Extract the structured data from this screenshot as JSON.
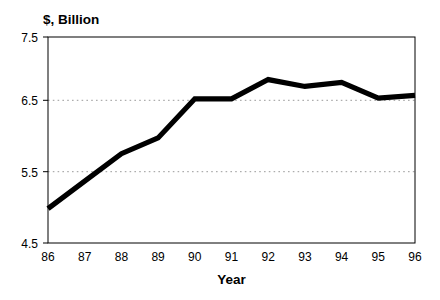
{
  "chart_data": {
    "type": "line",
    "title": "",
    "subtitle": "",
    "xlabel": "Year",
    "ylabel": "$, Billion",
    "ylabel_position": "top-left",
    "categories": [
      "86",
      "87",
      "88",
      "89",
      "90",
      "91",
      "92",
      "93",
      "94",
      "95",
      "96"
    ],
    "x": [
      86,
      87,
      88,
      89,
      90,
      91,
      92,
      93,
      94,
      95,
      96
    ],
    "values": [
      5.0,
      5.4,
      5.8,
      6.03,
      6.6,
      6.6,
      6.88,
      6.78,
      6.84,
      6.61,
      6.65
    ],
    "series": [
      {
        "name": "",
        "values": [
          5.0,
          5.4,
          5.8,
          6.03,
          6.6,
          6.6,
          6.88,
          6.78,
          6.84,
          6.61,
          6.65
        ],
        "color": "#000000",
        "line_width": 5.2
      }
    ],
    "ylim": [
      4.5,
      7.5
    ],
    "xlim": [
      86,
      96
    ],
    "yticks": [
      4.5,
      5.5,
      6.5,
      7.5
    ],
    "ytick_labels": [
      "4.5",
      "5.5",
      "6.5",
      "7.5"
    ],
    "xticks": [
      86,
      87,
      88,
      89,
      90,
      91,
      92,
      93,
      94,
      95,
      96
    ],
    "xtick_labels": [
      "86",
      "87",
      "88",
      "89",
      "90",
      "91",
      "92",
      "93",
      "94",
      "95",
      "96"
    ],
    "gridlines": {
      "horizontal": [
        5.5,
        6.5
      ],
      "style": "dotted",
      "color": "#9a9a9a",
      "vertical": []
    },
    "legend": {
      "visible": false,
      "position": "none",
      "entries": []
    },
    "annotations": [],
    "frame": {
      "color": "#000000",
      "background": "#ffffff"
    }
  },
  "labels": {
    "y_axis_unit": "$, Billion",
    "x_axis_title": "Year",
    "ytick_0": "4.5",
    "ytick_1": "5.5",
    "ytick_2": "6.5",
    "ytick_3": "7.5",
    "xtick_0": "86",
    "xtick_1": "87",
    "xtick_2": "88",
    "xtick_3": "89",
    "xtick_4": "90",
    "xtick_5": "91",
    "xtick_6": "92",
    "xtick_7": "93",
    "xtick_8": "94",
    "xtick_9": "95",
    "xtick_10": "96"
  }
}
